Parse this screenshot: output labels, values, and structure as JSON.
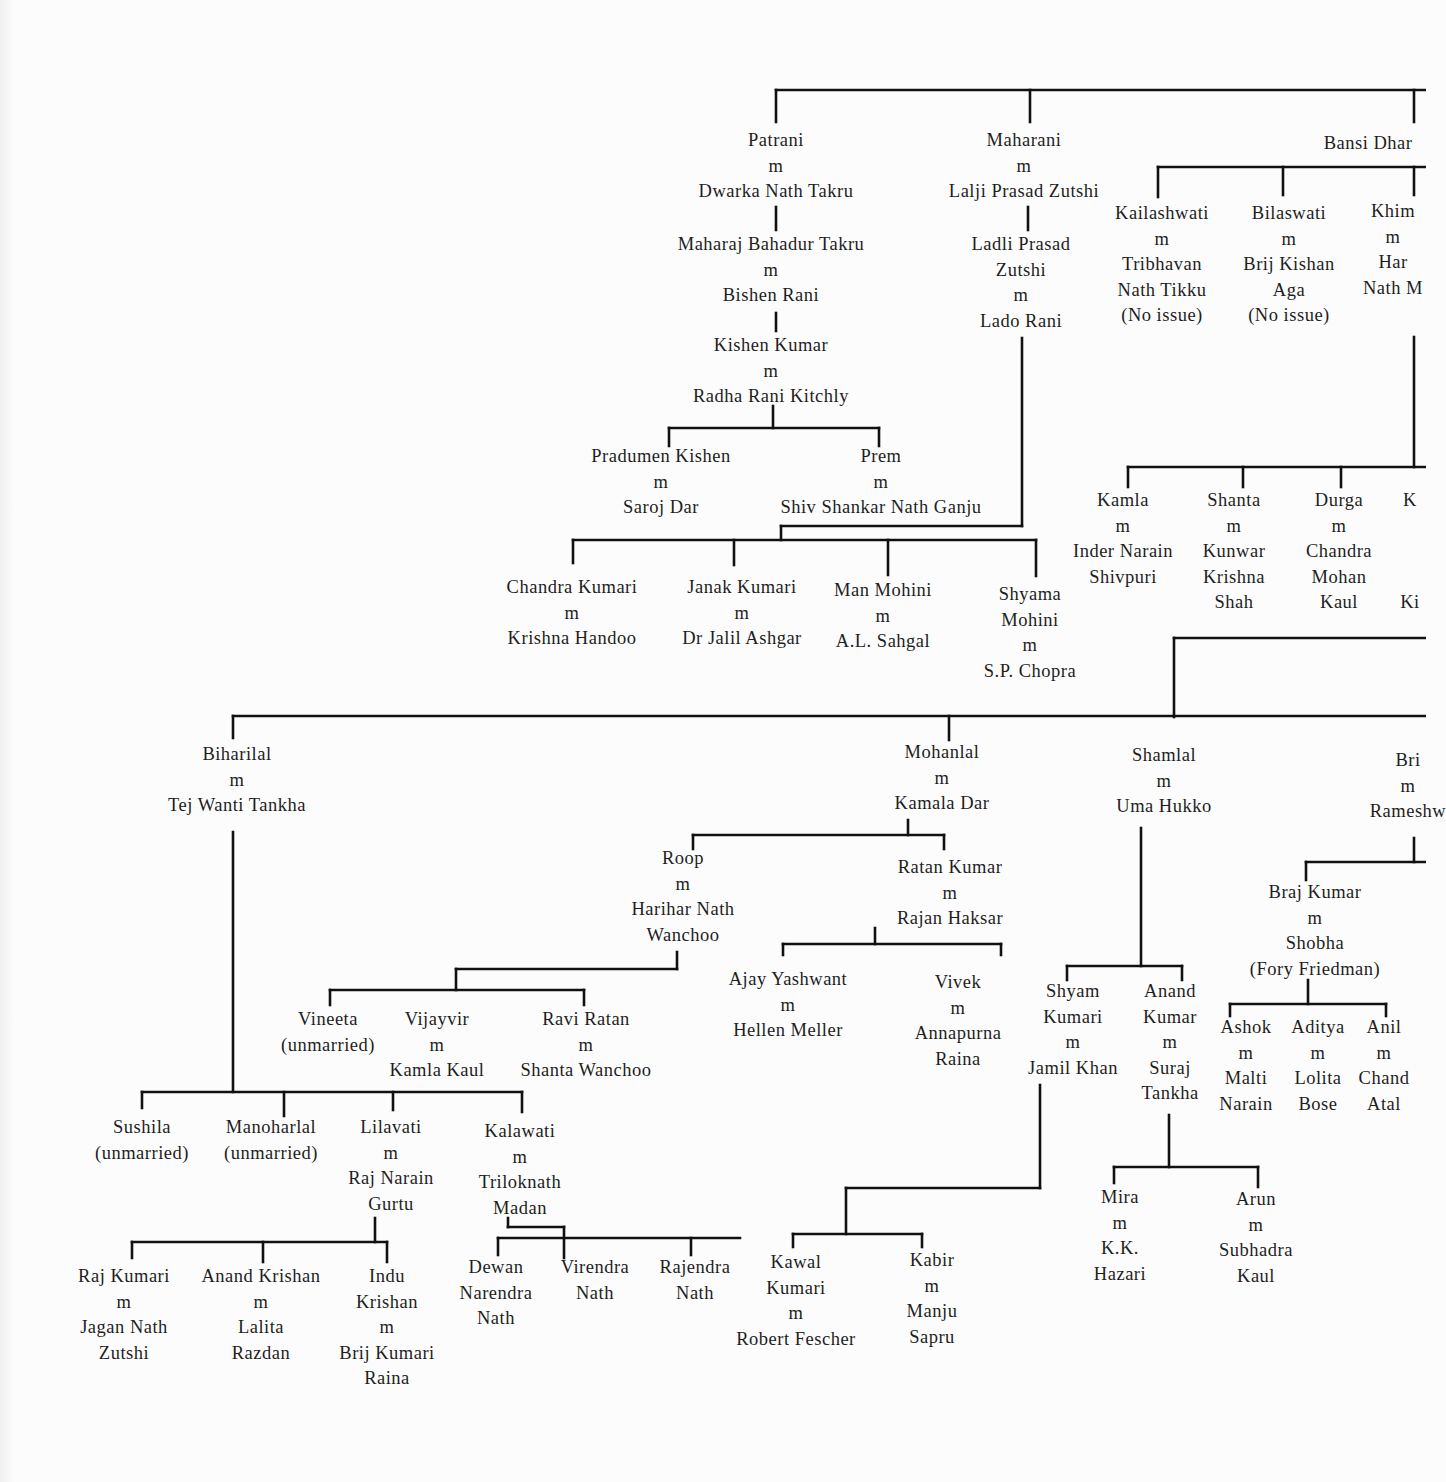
{
  "document": {
    "type": "genealogy-chart",
    "line_color": "#111111",
    "background_color": "#fcfcfc",
    "text_color": "#1e1e1e"
  },
  "nodes": [
    {
      "id": "patrani",
      "x": 776,
      "y": 128,
      "lines": [
        "Patrani",
        "m",
        "Dwarka Nath Takru"
      ]
    },
    {
      "id": "maharaj-bahadur",
      "x": 771,
      "y": 232,
      "lines": [
        "Maharaj Bahadur Takru",
        "m",
        "Bishen Rani"
      ]
    },
    {
      "id": "kishen-kumar",
      "x": 771,
      "y": 333,
      "lines": [
        "Kishen Kumar",
        "m",
        "Radha Rani Kitchly"
      ]
    },
    {
      "id": "pradumen",
      "x": 661,
      "y": 444,
      "lines": [
        "Pradumen Kishen",
        "m",
        "Saroj Dar"
      ]
    },
    {
      "id": "prem",
      "x": 881,
      "y": 444,
      "lines": [
        "Prem",
        "m",
        "Shiv Shankar Nath Ganju"
      ]
    },
    {
      "id": "maharani",
      "x": 1024,
      "y": 128,
      "lines": [
        "Maharani",
        "m",
        "Lalji Prasad Zutshi"
      ]
    },
    {
      "id": "ladli-prasad",
      "x": 1021,
      "y": 232,
      "lines": [
        "Ladli Prasad",
        "Zutshi",
        "m",
        "Lado Rani"
      ]
    },
    {
      "id": "chandra-kumari",
      "x": 572,
      "y": 575,
      "lines": [
        "Chandra Kumari",
        "m",
        "Krishna Handoo"
      ]
    },
    {
      "id": "janak-kumari",
      "x": 742,
      "y": 575,
      "lines": [
        "Janak Kumari",
        "m",
        "Dr Jalil Ashgar"
      ]
    },
    {
      "id": "man-mohini",
      "x": 883,
      "y": 578,
      "lines": [
        "Man Mohini",
        "m",
        "A.L. Sahgal"
      ]
    },
    {
      "id": "shyama-mohini",
      "x": 1030,
      "y": 582,
      "lines": [
        "Shyama",
        "Mohini",
        "m",
        "S.P. Chopra"
      ]
    },
    {
      "id": "bansi-dhar",
      "x": 1368,
      "y": 131,
      "lines": [
        "Bansi Dhar"
      ],
      "clipped": true
    },
    {
      "id": "kailashwati",
      "x": 1162,
      "y": 201,
      "lines": [
        "Kailashwati",
        "m",
        "Tribhavan",
        "Nath Tikku",
        "(No issue)"
      ]
    },
    {
      "id": "bilaswati",
      "x": 1289,
      "y": 201,
      "lines": [
        "Bilaswati",
        "m",
        "Brij Kishan",
        "Aga",
        "(No issue)"
      ]
    },
    {
      "id": "khim",
      "x": 1393,
      "y": 199,
      "lines": [
        "Khim",
        "m",
        "Har",
        "Nath M"
      ],
      "clipped": true
    },
    {
      "id": "kamla",
      "x": 1123,
      "y": 488,
      "lines": [
        "Kamla",
        "m",
        "Inder Narain",
        "Shivpuri"
      ]
    },
    {
      "id": "shanta",
      "x": 1234,
      "y": 488,
      "lines": [
        "Shanta",
        "m",
        "Kunwar",
        "Krishna",
        "Shah"
      ]
    },
    {
      "id": "durga",
      "x": 1339,
      "y": 488,
      "lines": [
        "Durga",
        "m",
        "Chandra",
        "Mohan",
        "Kaul"
      ]
    },
    {
      "id": "k-clipped",
      "x": 1410,
      "y": 488,
      "lines": [
        "K",
        "",
        "",
        "",
        "Ki"
      ],
      "clipped": true
    },
    {
      "id": "biharilal",
      "x": 237,
      "y": 742,
      "lines": [
        "Biharilal",
        "m",
        "Tej Wanti Tankha"
      ]
    },
    {
      "id": "mohanlal",
      "x": 942,
      "y": 740,
      "lines": [
        "Mohanlal",
        "m",
        "Kamala Dar"
      ]
    },
    {
      "id": "shamlal",
      "x": 1164,
      "y": 743,
      "lines": [
        "Shamlal",
        "m",
        "Uma Hukko"
      ]
    },
    {
      "id": "bri-clipped",
      "x": 1408,
      "y": 748,
      "lines": [
        "Bri",
        "m",
        "Rameshw"
      ],
      "clipped": true
    },
    {
      "id": "roop",
      "x": 683,
      "y": 846,
      "lines": [
        "Roop",
        "m",
        "Harihar Nath",
        "Wanchoo"
      ]
    },
    {
      "id": "ratan-kumar",
      "x": 950,
      "y": 855,
      "lines": [
        "Ratan Kumar",
        "m",
        "Rajan Haksar"
      ]
    },
    {
      "id": "ajay-yashwant",
      "x": 788,
      "y": 967,
      "lines": [
        "Ajay Yashwant",
        "m",
        "Hellen Meller"
      ]
    },
    {
      "id": "vivek",
      "x": 958,
      "y": 970,
      "lines": [
        "Vivek",
        "m",
        "Annapurna",
        "Raina"
      ]
    },
    {
      "id": "vineeta",
      "x": 328,
      "y": 1007,
      "lines": [
        "Vineeta",
        "(unmarried)"
      ]
    },
    {
      "id": "vijayvir",
      "x": 437,
      "y": 1007,
      "lines": [
        "Vijayvir",
        "m",
        "Kamla Kaul"
      ]
    },
    {
      "id": "ravi-ratan",
      "x": 586,
      "y": 1007,
      "lines": [
        "Ravi Ratan",
        "m",
        "Shanta Wanchoo"
      ]
    },
    {
      "id": "shyam-kumari",
      "x": 1073,
      "y": 979,
      "lines": [
        "Shyam",
        "Kumari",
        "m",
        "Jamil Khan"
      ]
    },
    {
      "id": "anand-kumar",
      "x": 1170,
      "y": 979,
      "lines": [
        "Anand",
        "Kumar",
        "m",
        "Suraj",
        "Tankha"
      ]
    },
    {
      "id": "braj-kumar",
      "x": 1315,
      "y": 880,
      "lines": [
        "Braj Kumar",
        "m",
        "Shobha",
        "(Fory Friedman)"
      ]
    },
    {
      "id": "ashok",
      "x": 1246,
      "y": 1015,
      "lines": [
        "Ashok",
        "m",
        "Malti",
        "Narain"
      ]
    },
    {
      "id": "aditya",
      "x": 1318,
      "y": 1015,
      "lines": [
        "Aditya",
        "m",
        "Lolita",
        "Bose"
      ]
    },
    {
      "id": "anil",
      "x": 1384,
      "y": 1015,
      "lines": [
        "Anil",
        "m",
        "Chand",
        "Atal"
      ]
    },
    {
      "id": "sushila",
      "x": 142,
      "y": 1115,
      "lines": [
        "Sushila",
        "(unmarried)"
      ]
    },
    {
      "id": "manoharlal",
      "x": 271,
      "y": 1115,
      "lines": [
        "Manoharlal",
        "(unmarried)"
      ]
    },
    {
      "id": "lilavati",
      "x": 391,
      "y": 1115,
      "lines": [
        "Lilavati",
        "m",
        "Raj Narain",
        "Gurtu"
      ]
    },
    {
      "id": "kalawati",
      "x": 520,
      "y": 1119,
      "lines": [
        "Kalawati",
        "m",
        "Triloknath",
        "Madan"
      ]
    },
    {
      "id": "raj-kumari",
      "x": 124,
      "y": 1264,
      "lines": [
        "Raj Kumari",
        "m",
        "Jagan Nath",
        "Zutshi"
      ]
    },
    {
      "id": "anand-krishan",
      "x": 261,
      "y": 1264,
      "lines": [
        "Anand Krishan",
        "m",
        "Lalita",
        "Razdan"
      ]
    },
    {
      "id": "indu-krishan",
      "x": 387,
      "y": 1264,
      "lines": [
        "Indu",
        "Krishan",
        "m",
        "Brij Kumari",
        "Raina"
      ]
    },
    {
      "id": "dewan-narendra",
      "x": 496,
      "y": 1255,
      "lines": [
        "Dewan",
        "Narendra",
        "Nath"
      ]
    },
    {
      "id": "virendra",
      "x": 595,
      "y": 1255,
      "lines": [
        "Virendra",
        "Nath"
      ]
    },
    {
      "id": "rajendra",
      "x": 695,
      "y": 1255,
      "lines": [
        "Rajendra",
        "Nath"
      ]
    },
    {
      "id": "kawal-kumari",
      "x": 796,
      "y": 1250,
      "lines": [
        "Kawal",
        "Kumari",
        "m",
        "Robert Fescher"
      ]
    },
    {
      "id": "kabir",
      "x": 932,
      "y": 1248,
      "lines": [
        "Kabir",
        "m",
        "Manju",
        "Sapru"
      ]
    },
    {
      "id": "mira",
      "x": 1120,
      "y": 1185,
      "lines": [
        "Mira",
        "m",
        "K.K.",
        "Hazari"
      ]
    },
    {
      "id": "arun",
      "x": 1256,
      "y": 1187,
      "lines": [
        "Arun",
        "m",
        "Subhadra",
        "Kaul"
      ]
    }
  ],
  "connectors": [
    [
      776,
      90,
      1426,
      90
    ],
    [
      776,
      90,
      776,
      122
    ],
    [
      1030,
      90,
      1030,
      122
    ],
    [
      1414,
      90,
      1414,
      122
    ],
    [
      776,
      207,
      776,
      230
    ],
    [
      1028,
      207,
      1028,
      230
    ],
    [
      776,
      313,
      776,
      331
    ],
    [
      773,
      406,
      773,
      428
    ],
    [
      669,
      428,
      879,
      428
    ],
    [
      669,
      428,
      669,
      446
    ],
    [
      879,
      428,
      879,
      446
    ],
    [
      1022,
      338,
      1022,
      526
    ],
    [
      781,
      526,
      1022,
      526
    ],
    [
      781,
      526,
      781,
      540
    ],
    [
      573,
      540,
      1036,
      540
    ],
    [
      573,
      540,
      573,
      563
    ],
    [
      734,
      540,
      734,
      565
    ],
    [
      888,
      540,
      888,
      575
    ],
    [
      1036,
      540,
      1036,
      576
    ],
    [
      1158,
      167,
      1426,
      167
    ],
    [
      1158,
      167,
      1158,
      197
    ],
    [
      1283,
      167,
      1283,
      195
    ],
    [
      1414,
      167,
      1414,
      195
    ],
    [
      1414,
      337,
      1414,
      467
    ],
    [
      1128,
      467,
      1426,
      467
    ],
    [
      1128,
      467,
      1128,
      487
    ],
    [
      1243,
      467,
      1243,
      487
    ],
    [
      1341,
      467,
      1341,
      487
    ],
    [
      1174,
      638,
      1426,
      638
    ],
    [
      1174,
      638,
      1174,
      717
    ],
    [
      233,
      716,
      1426,
      716
    ],
    [
      233,
      716,
      233,
      738
    ],
    [
      949,
      716,
      949,
      740
    ],
    [
      908,
      820,
      908,
      835
    ],
    [
      693,
      835,
      944,
      835
    ],
    [
      693,
      835,
      693,
      849
    ],
    [
      944,
      835,
      944,
      849
    ],
    [
      677,
      952,
      677,
      969
    ],
    [
      456,
      969,
      677,
      969
    ],
    [
      456,
      969,
      456,
      990
    ],
    [
      330,
      990,
      584,
      990
    ],
    [
      330,
      990,
      330,
      1005
    ],
    [
      584,
      990,
      584,
      1005
    ],
    [
      875,
      928,
      875,
      944
    ],
    [
      783,
      944,
      1001,
      944
    ],
    [
      783,
      944,
      783,
      955
    ],
    [
      1001,
      944,
      1001,
      955
    ],
    [
      233,
      832,
      233,
      1092
    ],
    [
      142,
      1092,
      522,
      1092
    ],
    [
      142,
      1092,
      142,
      1108
    ],
    [
      284,
      1092,
      284,
      1116
    ],
    [
      393,
      1092,
      393,
      1110
    ],
    [
      522,
      1092,
      522,
      1112
    ],
    [
      1141,
      828,
      1141,
      966
    ],
    [
      1067,
      966,
      1182,
      966
    ],
    [
      1067,
      966,
      1067,
      980
    ],
    [
      1182,
      966,
      1182,
      980
    ],
    [
      1414,
      838,
      1414,
      862
    ],
    [
      1306,
      862,
      1426,
      862
    ],
    [
      1306,
      862,
      1306,
      880
    ],
    [
      1308,
      980,
      1308,
      1004
    ],
    [
      1230,
      1004,
      1386,
      1004
    ],
    [
      1230,
      1004,
      1230,
      1016
    ],
    [
      1386,
      1004,
      1386,
      1016
    ],
    [
      375,
      1218,
      375,
      1242
    ],
    [
      132,
      1242,
      387,
      1242
    ],
    [
      132,
      1242,
      132,
      1258
    ],
    [
      263,
      1242,
      263,
      1262
    ],
    [
      387,
      1242,
      387,
      1262
    ],
    [
      508,
      1218,
      508,
      1227
    ],
    [
      508,
      1227,
      564,
      1227
    ],
    [
      564,
      1227,
      564,
      1258
    ],
    [
      498,
      1238,
      740,
      1238
    ],
    [
      498,
      1238,
      498,
      1255
    ],
    [
      691,
      1238,
      691,
      1255
    ],
    [
      1040,
      1085,
      1040,
      1188
    ],
    [
      846,
      1188,
      1040,
      1188
    ],
    [
      846,
      1188,
      846,
      1234
    ],
    [
      793,
      1234,
      922,
      1234
    ],
    [
      793,
      1234,
      793,
      1247
    ],
    [
      922,
      1234,
      922,
      1247
    ],
    [
      1169,
      1115,
      1169,
      1167
    ],
    [
      1114,
      1167,
      1258,
      1167
    ],
    [
      1114,
      1167,
      1114,
      1183
    ],
    [
      1258,
      1167,
      1258,
      1187
    ]
  ]
}
